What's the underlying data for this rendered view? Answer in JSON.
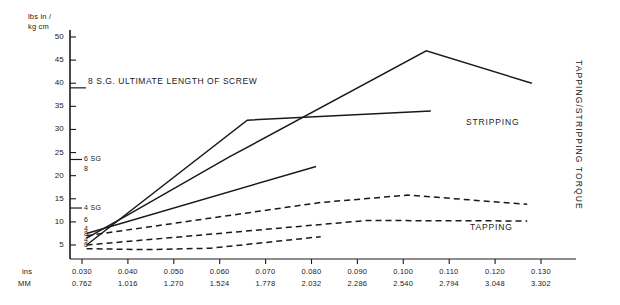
{
  "chart_data": {
    "type": "line",
    "title": "",
    "xlabel": "",
    "ylabel": "lbs in /\nkg cm",
    "y_axis_unit_line1": "lbs in /",
    "y_axis_unit_line2": "kg cm",
    "right_axis_label": "TAPPING/STRIPPING TORQUE",
    "ylim": [
      0,
      50
    ],
    "yticks": [
      5,
      10,
      15,
      20,
      25,
      30,
      35,
      40,
      45,
      50
    ],
    "xlim_in": [
      0.025,
      0.135
    ],
    "x_row_keys": [
      "ins",
      "MM"
    ],
    "xticks_in": [
      "0.030",
      "0.040",
      "0.050",
      "0.060",
      "0.070",
      "0.080",
      "0.090",
      "0.100",
      "0.110",
      "0.120",
      "0.130"
    ],
    "xticks_mm": [
      "0.762",
      "1.016",
      "1.270",
      "1.524",
      "1.778",
      "2.032",
      "2.286",
      "2.540",
      "2.794",
      "3.048",
      "3.302"
    ],
    "grid": false,
    "legend_position": "inline-annotations",
    "annotations": [
      {
        "text": "8 S.G. ULTIMATE LENGTH OF SCREW",
        "value": 39
      },
      {
        "text": "STRIPPING"
      },
      {
        "text": "TAPPING"
      }
    ],
    "gauge_labels": [
      {
        "text": "8 S.G. ULTIMATE LENGTH OF SCREW",
        "at_y": 39
      },
      {
        "text": "6 SG",
        "at_y": 23.5
      },
      {
        "text": "8",
        "at_y": 21.3
      },
      {
        "text": "4 SG",
        "at_y": 13
      },
      {
        "text": "6",
        "at_y": 10.2
      },
      {
        "text": "4",
        "at_y": 8.4
      },
      {
        "text": "8",
        "at_y": 7.3
      },
      {
        "text": "4",
        "at_y": 5.9
      },
      {
        "text": "6",
        "at_y": 4.8
      }
    ],
    "series": [
      {
        "name": "8 SG stripping",
        "style": "solid",
        "group": "STRIPPING",
        "x": [
          0.031,
          0.04,
          0.062,
          0.105,
          0.128
        ],
        "values": [
          6.5,
          11.5,
          24.0,
          47.0,
          40.0
        ]
      },
      {
        "name": "6 SG stripping",
        "style": "solid",
        "group": "STRIPPING",
        "x": [
          0.031,
          0.066,
          0.106
        ],
        "values": [
          5.0,
          32.0,
          34.0
        ]
      },
      {
        "name": "4 SG stripping",
        "style": "solid",
        "group": "STRIPPING",
        "x": [
          0.031,
          0.081
        ],
        "values": [
          7.5,
          22.0
        ]
      },
      {
        "name": "8 SG tapping",
        "style": "dashed",
        "group": "TAPPING",
        "x": [
          0.031,
          0.082,
          0.101,
          0.127
        ],
        "values": [
          7.0,
          14.2,
          15.8,
          13.8
        ]
      },
      {
        "name": "4 SG tapping",
        "style": "dashed",
        "group": "TAPPING",
        "x": [
          0.031,
          0.092,
          0.127
        ],
        "values": [
          5.0,
          10.3,
          10.2
        ]
      },
      {
        "name": "6 SG tapping",
        "style": "dashed",
        "group": "TAPPING",
        "x": [
          0.031,
          0.044,
          0.058,
          0.082
        ],
        "values": [
          4.2,
          4.0,
          4.3,
          6.8
        ]
      }
    ]
  },
  "colors": {
    "ink": "#1a1a1a",
    "background": "#ffffff"
  }
}
